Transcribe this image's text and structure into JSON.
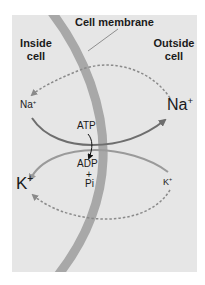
{
  "labels": {
    "membrane": "Cell membrane",
    "inside_line1": "Inside",
    "inside_line2": "cell",
    "outside_line1": "Outside",
    "outside_line2": "cell",
    "na_inside": "Na",
    "na_outside": "Na",
    "k_inside": "K",
    "k_outside": "K",
    "plus_sign": "+",
    "atp": "ATP",
    "adp": "ADP",
    "plus": "+",
    "pi": "Pi"
  },
  "colors": {
    "panel_bg": "#e6e6e6",
    "membrane": "#a8a8a8",
    "na_arrow": "#6e6e6e",
    "k_arrow": "#9a9a9a",
    "dashed": "#8a8a8a",
    "text": "#1a1a1a"
  }
}
